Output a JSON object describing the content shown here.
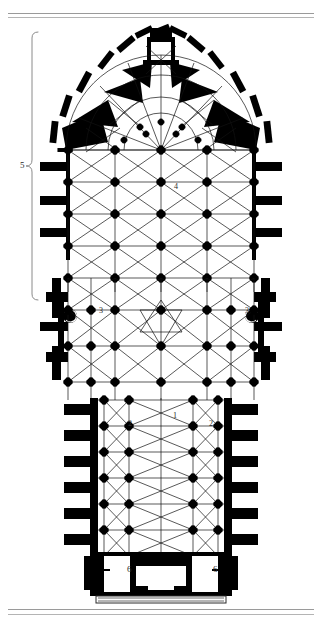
{
  "figure": {
    "type": "architectural-floor-plan",
    "background_color": "#ffffff",
    "ink_color": "#000000",
    "rule_color": "#9a9a9a"
  },
  "rules": {
    "top": [
      "top-rule-1",
      "top-rule-2"
    ],
    "bottom": [
      "bottom-rule-1",
      "bottom-rule-2"
    ]
  },
  "annotations": {
    "nave": "1",
    "nave_aisle_left": "2",
    "nave_aisle_right": "2",
    "transept_left": "3",
    "transept_right": "3",
    "choir": "4",
    "chevet_brace": "5",
    "tower_left": "6",
    "tower_right": "6"
  },
  "legend_keys": [
    {
      "key": "1",
      "region": "nave"
    },
    {
      "key": "2",
      "region": "nave-aisles"
    },
    {
      "key": "3",
      "region": "transept-arms"
    },
    {
      "key": "4",
      "region": "choir"
    },
    {
      "key": "5",
      "region": "chevet-and-apse"
    },
    {
      "key": "6",
      "region": "west-towers"
    }
  ],
  "plan_geometry": {
    "units": "px",
    "canvas": [
      322,
      626
    ],
    "apse": {
      "center_x": 161,
      "center_y": 150,
      "radius_outer": 92,
      "radius_inner": 52,
      "radiating_chapels": 7,
      "buttress_count": 13
    },
    "choir": {
      "x0": 62,
      "x1": 260,
      "y0": 148,
      "y1": 292,
      "bays": 4
    },
    "transept": {
      "x0": 42,
      "x1": 280,
      "y0": 255,
      "y1": 400
    },
    "nave": {
      "x0": 86,
      "x1": 236,
      "y0": 400,
      "y1": 560,
      "bays": 6
    },
    "west_block": {
      "x0": 90,
      "x1": 232,
      "y0": 552,
      "y1": 596
    }
  }
}
